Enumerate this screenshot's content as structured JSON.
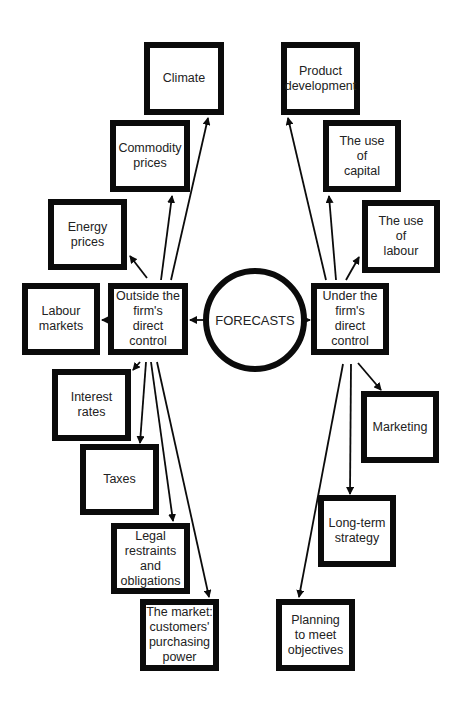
{
  "diagram": {
    "center": {
      "label": "FORECASTS"
    },
    "left_hub": {
      "label": "Outside the\nfirm's\ndirect\ncontrol"
    },
    "right_hub": {
      "label": "Under the\nfirm's\ndirect\ncontrol"
    },
    "left_nodes": [
      {
        "label": "Climate"
      },
      {
        "label": "Commodity\nprices"
      },
      {
        "label": "Energy\nprices"
      },
      {
        "label": "Labour\nmarkets"
      },
      {
        "label": "Interest\nrates"
      },
      {
        "label": "Taxes"
      },
      {
        "label": "Legal\nrestraints\nand\nobligations"
      },
      {
        "label": "The market:\ncustomers'\npurchasing\npower"
      }
    ],
    "right_nodes": [
      {
        "label": "Product\ndevelopment"
      },
      {
        "label": "The use\nof\ncapital"
      },
      {
        "label": "The use\nof\nlabour"
      },
      {
        "label": "Marketing"
      },
      {
        "label": "Long-term\nstrategy"
      },
      {
        "label": "Planning\nto meet\nobjectives"
      }
    ]
  }
}
